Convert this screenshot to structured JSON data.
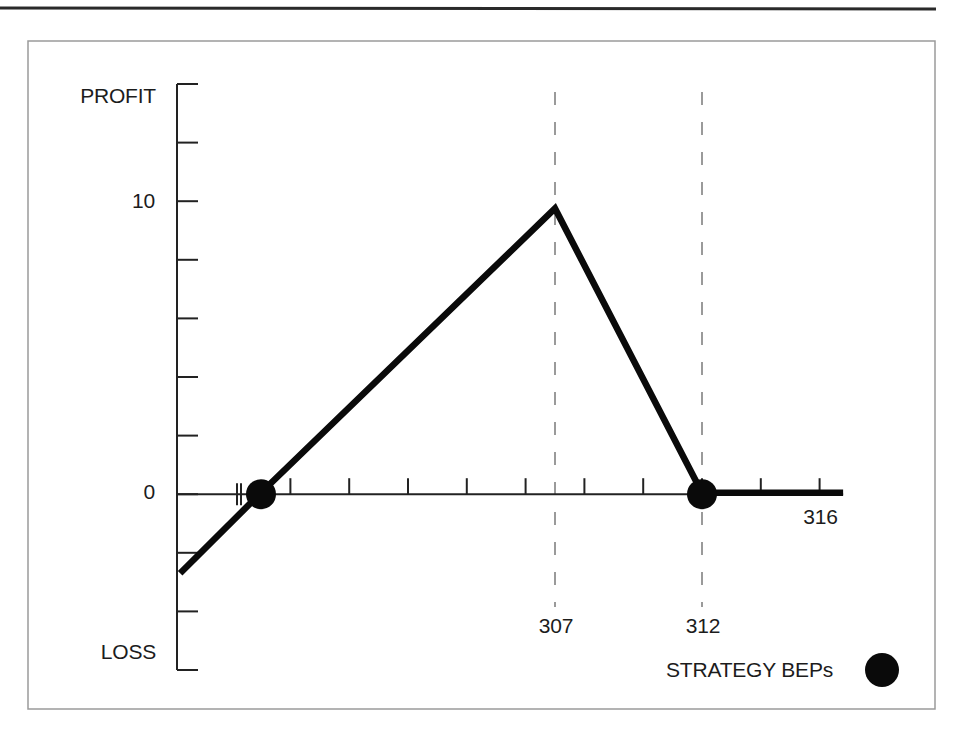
{
  "chart_data": {
    "type": "line",
    "title": "",
    "xlabel": "",
    "ylabel_top": "PROFIT",
    "ylabel_bottom": "LOSS",
    "xlim": [
      293,
      317
    ],
    "ylim": [
      -6,
      14
    ],
    "y_ticks": [
      14,
      12,
      10,
      8,
      6,
      4,
      2,
      0,
      -2,
      -4,
      -6
    ],
    "y_tick_labels": [
      {
        "value": 10,
        "label": "10"
      },
      {
        "value": 0,
        "label": "0"
      }
    ],
    "x_ticks": [
      298,
      300,
      302,
      304,
      306,
      308,
      310,
      312,
      314,
      316
    ],
    "x_tick_labels": [
      {
        "value": 307,
        "label": "307"
      },
      {
        "value": 312,
        "label": "312"
      },
      {
        "value": 316,
        "label": "316"
      }
    ],
    "x_axis_break": true,
    "reference_lines": [
      307,
      312
    ],
    "series": [
      {
        "name": "Strategy payoff",
        "points": [
          [
            294.25,
            -2.75
          ],
          [
            297,
            0
          ],
          [
            307,
            9.7
          ],
          [
            312,
            0
          ],
          [
            316.8,
            0
          ]
        ]
      }
    ],
    "breakeven_points": [
      297,
      312
    ],
    "legend": [
      {
        "label": "STRATEGY BEPs",
        "marker": "filled-circle"
      }
    ],
    "legend_position": "bottom-right",
    "grid": false,
    "colors": {
      "line": "#0a0a0a",
      "axis": "#222222",
      "reference": "#7a7a7a",
      "frame": "#9a9a9a"
    }
  }
}
